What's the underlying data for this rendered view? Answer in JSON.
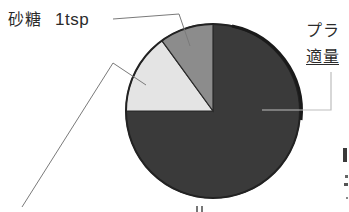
{
  "chart_data": {
    "type": "pie",
    "title": "",
    "start_angle_deg": 0,
    "direction": "clockwise",
    "slices": [
      {
        "name": "プラ…",
        "label_line1": "プラ…",
        "label_line2": "適量",
        "value": 75,
        "start_deg": 0,
        "end_deg": 270,
        "color": "#3a3a3a"
      },
      {
        "name": "(unlabeled)",
        "label_line1": "",
        "label_line2": "",
        "value": 15,
        "start_deg": 270,
        "end_deg": 324,
        "color": "#e4e4e4"
      },
      {
        "name": "砂糖",
        "label_line1": "砂糖",
        "label_line2": "1tsp",
        "value": 10,
        "start_deg": 324,
        "end_deg": 360,
        "color": "#8c8c8c"
      }
    ],
    "categories": [
      "プラ…",
      "(unlabeled)",
      "砂糖"
    ],
    "values": [
      75,
      15,
      10
    ],
    "legend": "none (leader-line callouts)",
    "grid": false
  },
  "labels": {
    "sugar": {
      "name": "砂糖",
      "qty": "1tsp"
    },
    "plastic": {
      "name": "プラ",
      "qty": "適量"
    }
  },
  "colors": {
    "outline": "#222222",
    "leader": "#7a7a7a",
    "dark": "#3a3a3a",
    "medium": "#8c8c8c",
    "light": "#e4e4e4"
  }
}
